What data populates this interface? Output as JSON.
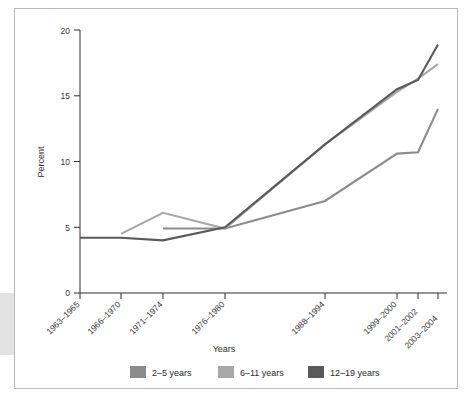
{
  "chart_data": {
    "type": "line",
    "title": "",
    "xlabel": "Years",
    "ylabel": "Percent",
    "ylim": [
      0,
      20
    ],
    "yticks": [
      0,
      5,
      10,
      15,
      20
    ],
    "ytick_labels": [
      "0",
      "5",
      "10",
      "15",
      "20"
    ],
    "grid": false,
    "legend_position": "bottom",
    "categories": [
      "1963–1965",
      "1966–1970",
      "1971–1974",
      "1976–1980",
      "1988–1994",
      "1999–2000",
      "2001–2002",
      "2003–2004"
    ],
    "series": [
      {
        "name": "2–5 years",
        "color": "#8c8c8c",
        "values": [
          null,
          null,
          4.9,
          4.9,
          7.0,
          10.6,
          10.7,
          14.0
        ]
      },
      {
        "name": "6–11 years",
        "color": "#a8a8a8",
        "values": [
          null,
          4.5,
          6.1,
          4.9,
          11.3,
          15.3,
          16.3,
          17.4
        ]
      },
      {
        "name": "12–19 years",
        "color": "#5a5a5a",
        "values": [
          4.2,
          4.2,
          4.0,
          5.0,
          11.3,
          15.5,
          16.2,
          18.9
        ]
      }
    ]
  },
  "axes": {
    "y_title": "Percent",
    "x_title": "Years",
    "y_tick_0": "0",
    "y_tick_1": "5",
    "y_tick_2": "10",
    "y_tick_3": "15",
    "y_tick_4": "20",
    "x_tick_0": "1963–1965",
    "x_tick_1": "1966–1970",
    "x_tick_2": "1971–1974",
    "x_tick_3": "1976–1980",
    "x_tick_4": "1988–1994",
    "x_tick_5": "1999–2000",
    "x_tick_6": "2001–2002",
    "x_tick_7": "2003–2004"
  },
  "legend": {
    "items": [
      {
        "label": "2–5 years",
        "color": "#8c8c8c"
      },
      {
        "label": "6–11 years",
        "color": "#a8a8a8"
      },
      {
        "label": "12–19 years",
        "color": "#5a5a5a"
      }
    ],
    "item_0_label": "2–5 years",
    "item_1_label": "6–11 years",
    "item_2_label": "12–19 years"
  },
  "colors": {
    "frame": "#b9b9b9",
    "axis": "#2f2f2f",
    "series_2_5": "#8c8c8c",
    "series_6_11": "#a8a8a8",
    "series_12_19": "#5a5a5a",
    "edge_block": "#e3e3e3"
  }
}
